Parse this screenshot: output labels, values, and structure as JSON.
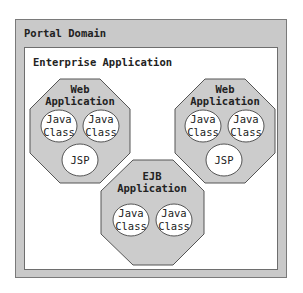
{
  "portal_domain": {
    "title": "Portal Domain"
  },
  "enterprise_application": {
    "title": "Enterprise Application"
  },
  "modules": [
    {
      "name": "Web Application (left)",
      "title_line1": "Web",
      "title_line2": "Application",
      "components": [
        {
          "line1": "Java",
          "line2": "Class"
        },
        {
          "line1": "Java",
          "line2": "Class"
        },
        {
          "line1": "JSP",
          "line2": ""
        }
      ]
    },
    {
      "name": "Web Application (right)",
      "title_line1": "Web",
      "title_line2": "Application",
      "components": [
        {
          "line1": "Java",
          "line2": "Class"
        },
        {
          "line1": "Java",
          "line2": "Class"
        },
        {
          "line1": "JSP",
          "line2": ""
        }
      ]
    },
    {
      "name": "EJB Application",
      "title_line1": "EJB",
      "title_line2": "Application",
      "components": [
        {
          "line1": "Java",
          "line2": "Class"
        },
        {
          "line1": "Java",
          "line2": "Class"
        }
      ]
    }
  ],
  "colors": {
    "container_fill": "#c9c9c9",
    "octagon_fill": "#cccccc",
    "stroke": "#555555",
    "circle_fill": "#ffffff"
  }
}
